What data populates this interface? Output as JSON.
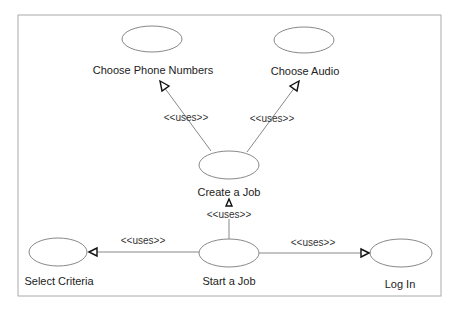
{
  "diagram": {
    "type": "uml-use-case",
    "use_cases": [
      {
        "id": "phone",
        "label": "Choose Phone Numbers"
      },
      {
        "id": "audio",
        "label": "Choose Audio"
      },
      {
        "id": "create",
        "label": "Create a Job"
      },
      {
        "id": "criteria",
        "label": "Select Criteria"
      },
      {
        "id": "start",
        "label": "Start a Job"
      },
      {
        "id": "login",
        "label": "Log In"
      }
    ],
    "relations": [
      {
        "from": "create",
        "to": "phone",
        "label": "<<uses>>"
      },
      {
        "from": "create",
        "to": "audio",
        "label": "<<uses>>"
      },
      {
        "from": "start",
        "to": "create",
        "label": "<<uses>>"
      },
      {
        "from": "start",
        "to": "criteria",
        "label": "<<uses>>"
      },
      {
        "from": "start",
        "to": "login",
        "label": "<<uses>>"
      }
    ]
  }
}
